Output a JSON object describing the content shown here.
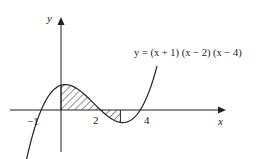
{
  "diagram": {
    "equation": "y = (x + 1) (x − 2) (x − 4)",
    "y_axis_label": "y",
    "x_axis_label": "x",
    "tick_labels": [
      "−1",
      "2",
      "4"
    ],
    "roots": [
      -1,
      2,
      4
    ],
    "shaded_regions": [
      [
        0,
        2
      ],
      [
        2,
        3
      ]
    ],
    "colors": {
      "line": "#222222",
      "background": "#ffffff"
    }
  }
}
